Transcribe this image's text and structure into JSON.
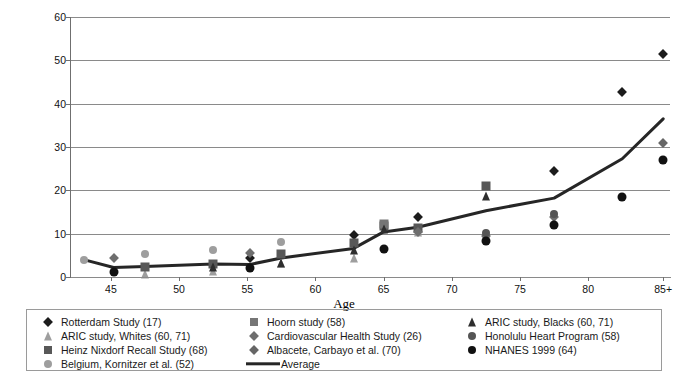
{
  "chart_data": {
    "type": "scatter",
    "title": "",
    "xlabel": "Age",
    "ylabel": "Rates (%)",
    "xlim": [
      42,
      86
    ],
    "ylim": [
      0,
      60
    ],
    "yticks": [
      0,
      10,
      20,
      30,
      40,
      50,
      60
    ],
    "xticks": [
      "45",
      "50",
      "55",
      "60",
      "65",
      "70",
      "75",
      "80",
      "85+"
    ],
    "xtick_values": [
      45,
      50,
      55,
      60,
      65,
      70,
      75,
      80,
      85.5
    ],
    "grid": "horizontal",
    "legend_position": "bottom",
    "series": [
      {
        "name": "Rotterdam Study (17)",
        "marker": "diamond",
        "color": "#1c1c1c",
        "size": 7,
        "points": [
          [
            55.2,
            4.4
          ],
          [
            62.8,
            9.8
          ],
          [
            67.5,
            13.8
          ],
          [
            77.5,
            24.5
          ],
          [
            82.5,
            42.7
          ],
          [
            85.5,
            51.5
          ]
        ]
      },
      {
        "name": "ARIC study, Whites (60, 71)",
        "marker": "triangle",
        "color": "#9e9e9e",
        "size": 9,
        "points": [
          [
            47.5,
            0.8
          ],
          [
            52.5,
            1.5
          ],
          [
            57.5,
            3.2
          ],
          [
            62.8,
            4.3
          ],
          [
            67.5,
            10.4
          ],
          [
            72.5,
            9.9
          ]
        ]
      },
      {
        "name": "Heinz Nixdorf Recall Study (68)",
        "marker": "square",
        "color": "#585858",
        "size": 9,
        "points": [
          [
            47.5,
            2.3
          ],
          [
            52.5,
            3.1
          ],
          [
            57.5,
            5.3
          ],
          [
            62.8,
            7.9
          ],
          [
            65.0,
            11.8
          ],
          [
            67.5,
            11.2
          ],
          [
            72.5,
            20.9
          ]
        ]
      },
      {
        "name": "Belgium, Kornitzer et al. (52)",
        "marker": "circle",
        "color": "#9e9e9e",
        "size": 8,
        "points": [
          [
            43.0,
            4.0
          ],
          [
            47.5,
            5.2
          ],
          [
            52.5,
            6.2
          ],
          [
            57.5,
            8.0
          ]
        ]
      },
      {
        "name": "Hoorn study (58)",
        "marker": "square",
        "color": "#767676",
        "size": 9,
        "points": [
          [
            65.0,
            12.2
          ]
        ]
      },
      {
        "name": "Cardiovascular Health Study (26)",
        "marker": "diamond",
        "color": "#6e6e6e",
        "size": 7,
        "points": [
          [
            45.2,
            4.4
          ],
          [
            55.2,
            5.6
          ],
          [
            67.5,
            10.5
          ],
          [
            72.5,
            9.5
          ],
          [
            77.5,
            13.8
          ]
        ]
      },
      {
        "name": "Albacete, Carbayo et al. (70)",
        "marker": "diamond",
        "color": "#666666",
        "size": 7,
        "points": [
          [
            85.5,
            31.0
          ]
        ]
      },
      {
        "name": "ARIC study, Blacks (60, 71)",
        "marker": "triangle",
        "color": "#2e2e2e",
        "size": 9,
        "points": [
          [
            52.5,
            2.4
          ],
          [
            57.5,
            3.3
          ],
          [
            62.8,
            6.3
          ],
          [
            65.0,
            11.0
          ],
          [
            72.5,
            18.6
          ]
        ]
      },
      {
        "name": "Honolulu Heart Program (58)",
        "marker": "circle",
        "color": "#555555",
        "size": 8,
        "points": [
          [
            72.5,
            10.1
          ],
          [
            77.5,
            14.6
          ]
        ]
      },
      {
        "name": "NHANES 1999 (64)",
        "marker": "circle",
        "color": "#111111",
        "size": 9,
        "points": [
          [
            45.2,
            1.2
          ],
          [
            55.2,
            2.1
          ],
          [
            65.0,
            6.5
          ],
          [
            72.5,
            8.2
          ],
          [
            77.5,
            12.0
          ],
          [
            82.5,
            18.4
          ],
          [
            85.5,
            27.0
          ]
        ]
      },
      {
        "name": "Average",
        "marker": "line",
        "color": "#262626",
        "size": 3,
        "points": [
          [
            43.0,
            4.0
          ],
          [
            45.2,
            2.2
          ],
          [
            47.5,
            2.4
          ],
          [
            52.5,
            3.0
          ],
          [
            55.2,
            2.9
          ],
          [
            57.5,
            4.4
          ],
          [
            62.8,
            6.6
          ],
          [
            65.0,
            10.4
          ],
          [
            67.5,
            11.5
          ],
          [
            72.5,
            15.3
          ],
          [
            77.5,
            18.2
          ],
          [
            82.5,
            27.3
          ],
          [
            85.5,
            36.5
          ]
        ]
      }
    ]
  },
  "legend": {
    "columns": [
      {
        "items": [
          {
            "label": "Rotterdam Study (17)",
            "marker": "diamond",
            "color": "#1c1c1c"
          },
          {
            "label": "ARIC study, Whites (60, 71)",
            "marker": "triangle",
            "color": "#9e9e9e"
          },
          {
            "label": "Heinz Nixdorf Recall Study (68)",
            "marker": "square",
            "color": "#585858"
          },
          {
            "label": "Belgium, Kornitzer et al. (52)",
            "marker": "circle",
            "color": "#9e9e9e"
          }
        ]
      },
      {
        "items": [
          {
            "label": "Hoorn study (58)",
            "marker": "square",
            "color": "#767676"
          },
          {
            "label": "Cardiovascular Health Study (26)",
            "marker": "diamond",
            "color": "#6e6e6e"
          },
          {
            "label": "Albacete, Carbayo et al. (70)",
            "marker": "diamond",
            "color": "#666666"
          },
          {
            "label": "Average",
            "marker": "line",
            "color": "#262626"
          }
        ]
      },
      {
        "items": [
          {
            "label": "ARIC study, Blacks (60, 71)",
            "marker": "triangle",
            "color": "#2e2e2e"
          },
          {
            "label": "Honolulu Heart Program (58)",
            "marker": "circle",
            "color": "#555555"
          },
          {
            "label": "NHANES 1999 (64)",
            "marker": "circle",
            "color": "#111111"
          }
        ]
      }
    ]
  },
  "colors": {
    "grid": "#8a8a8a",
    "axis": "#6f6f6f",
    "average_line": "#262626",
    "background": "#ffffff"
  }
}
